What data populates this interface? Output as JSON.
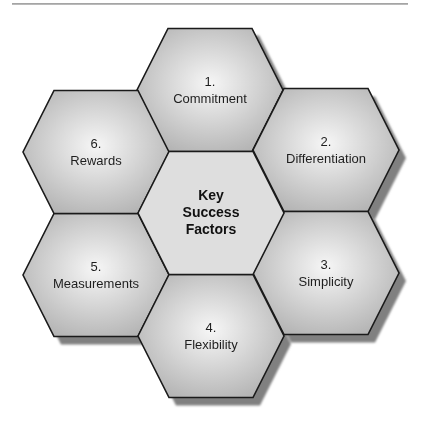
{
  "diagram": {
    "type": "hexagon-cluster",
    "center": {
      "lines": [
        "Key",
        "Success",
        "Factors"
      ]
    },
    "factors": [
      {
        "number": "1.",
        "label": "Commitment"
      },
      {
        "number": "2.",
        "label": "Differentiation"
      },
      {
        "number": "3.",
        "label": "Simplicity"
      },
      {
        "number": "4.",
        "label": "Flexibility"
      },
      {
        "number": "5.",
        "label": "Measurements"
      },
      {
        "number": "6.",
        "label": "Rewards"
      }
    ],
    "colors": {
      "hex_fill_light": "#f4f4f4",
      "hex_fill_dark": "#b9b9b9",
      "center_fill": "#dedede",
      "stroke": "#1a1a1a",
      "shadow": "#7f7f7f",
      "rule": "#a8a8a8"
    }
  }
}
